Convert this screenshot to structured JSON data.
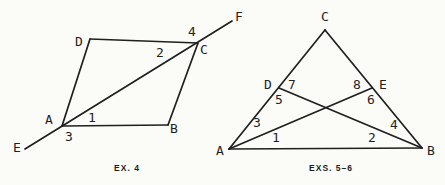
{
  "canvas": {
    "width": 445,
    "height": 185,
    "background": "#fbfbf8",
    "ink": "#1f1f1f",
    "stroke_width": 1.7
  },
  "figures": {
    "ex4": {
      "caption": "EX. 4",
      "caption_pos": {
        "x": 127,
        "y": 163
      },
      "points": {
        "A": [
          62,
          126
        ],
        "B": [
          168,
          125
        ],
        "C": [
          198,
          43
        ],
        "D": [
          90,
          39
        ],
        "E_end": [
          25,
          149
        ],
        "F_end": [
          232,
          21
        ]
      },
      "segments": [
        [
          "D",
          "C"
        ],
        [
          "C",
          "B"
        ],
        [
          "B",
          "A"
        ],
        [
          "A",
          "D"
        ],
        [
          "E_end",
          "F_end"
        ]
      ],
      "labels": [
        {
          "text": "A",
          "kind": "vertex",
          "x": 49,
          "y": 119
        },
        {
          "text": "B",
          "kind": "vertex",
          "x": 174,
          "y": 128
        },
        {
          "text": "C",
          "kind": "vertex",
          "x": 204,
          "y": 49
        },
        {
          "text": "D",
          "kind": "vertex",
          "x": 79,
          "y": 41
        },
        {
          "text": "E",
          "kind": "vertex",
          "x": 17,
          "y": 147
        },
        {
          "text": "F",
          "kind": "vertex",
          "x": 239,
          "y": 16
        },
        {
          "text": "1",
          "kind": "angle",
          "x": 92,
          "y": 117
        },
        {
          "text": "2",
          "kind": "angle",
          "x": 160,
          "y": 52
        },
        {
          "text": "3",
          "kind": "angle",
          "x": 69,
          "y": 136
        },
        {
          "text": "4",
          "kind": "angle",
          "x": 192,
          "y": 31
        }
      ]
    },
    "exs56": {
      "caption": "EXS. 5–6",
      "caption_pos": {
        "x": 331,
        "y": 163
      },
      "points": {
        "A": [
          229,
          149
        ],
        "B": [
          422,
          148
        ],
        "C": [
          325,
          30
        ],
        "D": [
          279,
          88
        ],
        "E": [
          372,
          88
        ]
      },
      "segments": [
        [
          "A",
          "C"
        ],
        [
          "C",
          "B"
        ],
        [
          "B",
          "A"
        ],
        [
          "B",
          "D"
        ],
        [
          "A",
          "E"
        ]
      ],
      "labels": [
        {
          "text": "A",
          "kind": "vertex",
          "x": 220,
          "y": 150
        },
        {
          "text": "B",
          "kind": "vertex",
          "x": 431,
          "y": 150
        },
        {
          "text": "C",
          "kind": "vertex",
          "x": 325,
          "y": 16
        },
        {
          "text": "D",
          "kind": "vertex",
          "x": 268,
          "y": 84
        },
        {
          "text": "E",
          "kind": "vertex",
          "x": 383,
          "y": 84
        },
        {
          "text": "1",
          "kind": "angle",
          "x": 276,
          "y": 137
        },
        {
          "text": "2",
          "kind": "angle",
          "x": 372,
          "y": 137
        },
        {
          "text": "3",
          "kind": "angle",
          "x": 257,
          "y": 122
        },
        {
          "text": "4",
          "kind": "angle",
          "x": 394,
          "y": 124
        },
        {
          "text": "5",
          "kind": "angle",
          "x": 279,
          "y": 99
        },
        {
          "text": "6",
          "kind": "angle",
          "x": 371,
          "y": 99
        },
        {
          "text": "7",
          "kind": "angle",
          "x": 292,
          "y": 84
        },
        {
          "text": "8",
          "kind": "angle",
          "x": 357,
          "y": 84
        }
      ]
    }
  }
}
